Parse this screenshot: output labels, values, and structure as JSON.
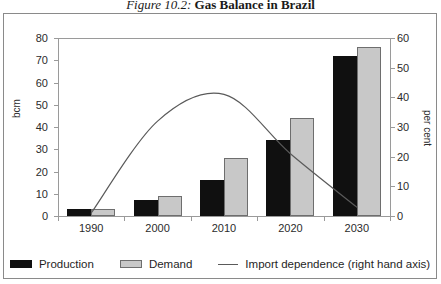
{
  "title": {
    "figure_number": "Figure 10.2:",
    "figure_name": "Gas Balance in Brazil"
  },
  "axes": {
    "left_label": "bcm",
    "right_label": "per cent",
    "left_ticks": [
      "0",
      "10",
      "20",
      "30",
      "40",
      "50",
      "60",
      "70",
      "80"
    ],
    "right_ticks": [
      "0",
      "10",
      "20",
      "30",
      "40",
      "50",
      "60"
    ]
  },
  "legend": {
    "items": [
      {
        "label": "Production",
        "swatch": "prod",
        "color": "#101010"
      },
      {
        "label": "Demand",
        "swatch": "dem",
        "color": "#c8c8c8"
      },
      {
        "label": "Import dependence (right hand axis)",
        "swatch": "line",
        "color": "#5a5a5a"
      }
    ]
  },
  "chart_data": {
    "type": "bar",
    "title": "Figure 10.2: Gas Balance in Brazil",
    "categories": [
      "1990",
      "2000",
      "2010",
      "2020",
      "2030"
    ],
    "xlabel": "",
    "ylabel": "bcm",
    "ylim": [
      0,
      80
    ],
    "y2label": "per cent",
    "y2lim": [
      0,
      60
    ],
    "grid": false,
    "legend_position": "bottom",
    "series": [
      {
        "name": "Production",
        "type": "bar",
        "axis": "left",
        "color": "#101010",
        "values": [
          3,
          7,
          16,
          34,
          72
        ]
      },
      {
        "name": "Demand",
        "type": "bar",
        "axis": "left",
        "color": "#c8c8c8",
        "values": [
          3,
          9,
          26,
          44,
          76
        ]
      },
      {
        "name": "Import dependence (right hand axis)",
        "type": "line",
        "axis": "right",
        "color": "#5a5a5a",
        "values": [
          1,
          32,
          41,
          21,
          3
        ]
      }
    ]
  }
}
